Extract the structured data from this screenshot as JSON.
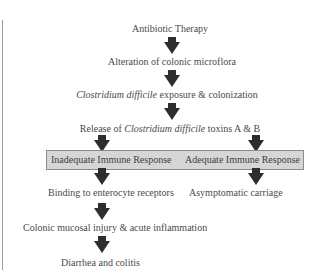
{
  "diagram": {
    "nodes": {
      "antibiotic": "Antibiotic Therapy",
      "alteration": "Alteration of colonic microflora",
      "exposure_italic": "Clostridium difficile",
      "exposure_rest": " exposure & colonization",
      "release_pre": "Release of ",
      "release_italic": "Clostridium difficile",
      "release_post": " toxins A & B",
      "inadequate": "Inadequate Immune Response",
      "adequate": "Adequate Immune Response",
      "binding": "Binding to enterocyte receptors",
      "asymptomatic": "Asymptomatic carriage",
      "injury": "Colonic mucosal injury & acute inflammation",
      "diarrhea": "Diarrhea and colitis"
    },
    "edges": [
      [
        "antibiotic",
        "alteration"
      ],
      [
        "alteration",
        "exposure"
      ],
      [
        "exposure",
        "release"
      ],
      [
        "release",
        "inadequate"
      ],
      [
        "release",
        "adequate"
      ],
      [
        "inadequate",
        "binding"
      ],
      [
        "adequate",
        "asymptomatic"
      ],
      [
        "binding",
        "injury"
      ],
      [
        "injury",
        "diarrhea"
      ]
    ],
    "colors": {
      "arrow": "#2e2e2e",
      "box_fill": "#d6d6d6",
      "box_border": "#8a8a8a",
      "text": "#4a4a4a"
    }
  }
}
